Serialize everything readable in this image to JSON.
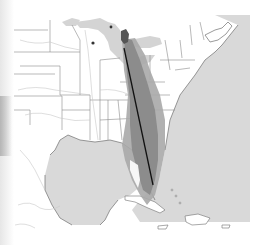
{
  "map": {
    "title": "Eastern North America range map",
    "region": "Eastern United States, Gulf of Mexico, Caribbean",
    "colors": {
      "background": "#ffffff",
      "land": "#ffffff",
      "water": "#d9d9d9",
      "great_lakes": "#d4d4d4",
      "borders": "#8a8a8a",
      "rivers": "#c8c8c8",
      "range_light": "#a9a9a9",
      "range_dark": "#8c8c8c",
      "range_core": "#555555",
      "route_line": "#111111",
      "point_marker": "#333333"
    },
    "layers": {
      "range_band": {
        "label": "Shaded range band",
        "from": "Michigan / Great Lakes",
        "to": "Southern Florida"
      },
      "route_line": {
        "label": "Migration route line",
        "from": "Ohio / Great Lakes",
        "to": "Central Florida"
      },
      "markers": [
        {
          "label": "Point marker 1",
          "x": 93,
          "y": 43
        },
        {
          "label": "Point marker 2",
          "x": 111,
          "y": 27
        }
      ]
    }
  }
}
